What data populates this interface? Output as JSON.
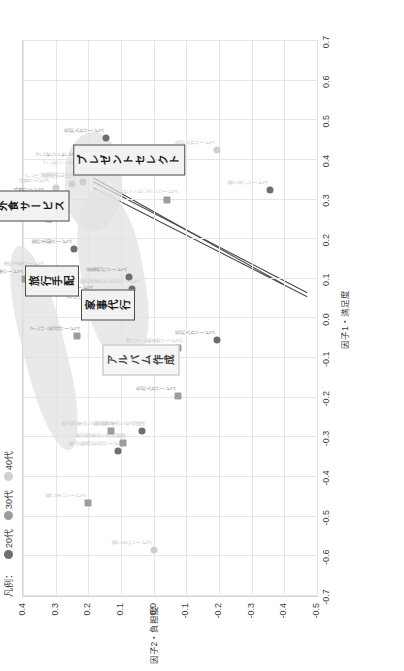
{
  "legend": {
    "label": "凡例：",
    "items": [
      {
        "name": "20代",
        "color": "#6e6e6e"
      },
      {
        "name": "30代",
        "color": "#9d9d9d"
      },
      {
        "name": "40代",
        "color": "#cfcfcf"
      }
    ]
  },
  "chart_data": {
    "type": "scatter",
    "title": "",
    "xlabel": "因子1・満足度",
    "ylabel": "因子2・負担度",
    "xlim": [
      -0.7,
      0.7
    ],
    "ylim": [
      -0.5,
      0.4
    ],
    "xticks": [
      "-0.7",
      "-0.6",
      "-0.5",
      "-0.4",
      "-0.3",
      "-0.2",
      "-0.1",
      "0.0",
      "0.1",
      "0.2",
      "0.3",
      "0.4",
      "0.5",
      "0.6",
      "0.7"
    ],
    "yticks": [
      "0.4",
      "0.3",
      "0.2",
      "0.1",
      "0.0",
      "-0.1",
      "-0.2",
      "-0.3",
      "-0.4",
      "-0.5"
    ],
    "grid": true,
    "legend_position": "top-left",
    "series": [
      {
        "name": "20代",
        "color": "#6e6e6e",
        "marker": "circle",
        "points": [
          {
            "label": "旅行手配サービス",
            "x": 0.175,
            "y": 0.245,
            "tone": "mid"
          },
          {
            "label": "外食サービス",
            "x": 0.305,
            "y": 0.315,
            "tone": "mid"
          },
          {
            "label": "アルバム作成サービス",
            "x": 0.035,
            "y": 0.12,
            "tone": "mid"
          },
          {
            "label": "家事代行サービス",
            "x": 0.105,
            "y": 0.075,
            "tone": "mid"
          },
          {
            "label": "親の将来のための保険",
            "x": -0.285,
            "y": 0.035,
            "tone": "pale"
          },
          {
            "label": "親の結婚記念日サービス",
            "x": -0.335,
            "y": 0.11,
            "tone": "pale"
          },
          {
            "label": "プレゼントセレクトサービス",
            "x": 0.395,
            "y": 0.195,
            "tone": "mid"
          },
          {
            "label": "名刺入れサービス",
            "x": 0.455,
            "y": 0.145,
            "tone": "mid"
          },
          {
            "label": "名刺入れサービス",
            "x": -0.055,
            "y": -0.195,
            "tone": "mid"
          },
          {
            "label": "墓じまいサービス",
            "x": 0.325,
            "y": -0.355,
            "tone": "pale"
          },
          {
            "label": "親の将来のためのサービス",
            "x": 0.075,
            "y": 0.065,
            "tone": "pale"
          }
        ]
      },
      {
        "name": "30代",
        "color": "#9d9d9d",
        "marker": "square",
        "points": [
          {
            "label": "旅行手配サービス",
            "x": 0.1,
            "y": 0.395,
            "tone": "mid"
          },
          {
            "label": "外食サービス",
            "x": 0.25,
            "y": 0.32,
            "tone": "mid"
          },
          {
            "label": "アルバム作成サービス",
            "x": -0.045,
            "y": 0.235,
            "tone": "mid"
          },
          {
            "label": "家事代行サービス",
            "x": 0.06,
            "y": 0.18,
            "tone": "mid"
          },
          {
            "label": "親の将来のための保険",
            "x": -0.315,
            "y": 0.095,
            "tone": "pale"
          },
          {
            "label": "親の将来のための積立て",
            "x": -0.285,
            "y": 0.13,
            "tone": "pale"
          },
          {
            "label": "埋立て（樹木葬サービス）",
            "x": -0.075,
            "y": -0.075,
            "tone": "pale"
          },
          {
            "label": "プレゼントセレクトサービス",
            "x": 0.3,
            "y": -0.04,
            "tone": "pale"
          },
          {
            "label": "名刺入れサービス",
            "x": -0.195,
            "y": -0.075,
            "tone": "mid"
          },
          {
            "label": "墓じまいサービス",
            "x": -0.465,
            "y": 0.2,
            "tone": "pale"
          }
        ]
      },
      {
        "name": "40代",
        "color": "#cfcfcf",
        "marker": "circle",
        "points": [
          {
            "label": "旅行手配サービス",
            "x": 0.12,
            "y": 0.33,
            "tone": "pale"
          },
          {
            "label": "外食サービス",
            "x": 0.33,
            "y": 0.3,
            "tone": "pale"
          },
          {
            "label": "アルバム作成サービス",
            "x": 0.34,
            "y": 0.25,
            "tone": "pale"
          },
          {
            "label": "家事代行サービス",
            "x": 0.345,
            "y": 0.215,
            "tone": "pale"
          },
          {
            "label": "プレゼントセレクトサービス",
            "x": 0.375,
            "y": 0.175,
            "tone": "pale"
          },
          {
            "label": "親の将来のためのサービス",
            "x": -0.115,
            "y": -0.025,
            "tone": "pale"
          },
          {
            "label": "名刺入れサービス",
            "x": 0.425,
            "y": -0.195,
            "tone": "pale"
          },
          {
            "label": "墓じまいサービス",
            "x": -0.585,
            "y": 0.0,
            "tone": "pale"
          }
        ]
      }
    ],
    "callouts": [
      {
        "text": "旅行手配",
        "x": 0.095,
        "y": 0.31,
        "style": "dark"
      },
      {
        "text": "外食サービス",
        "x": 0.285,
        "y": 0.375,
        "style": "dark"
      },
      {
        "text": "家事代行",
        "x": 0.035,
        "y": 0.14,
        "style": "dark"
      },
      {
        "text": "アルバム作成",
        "x": -0.105,
        "y": 0.04,
        "style": "light"
      },
      {
        "text": "プレゼントセレクト",
        "x": 0.4,
        "y": 0.075,
        "style": "dark"
      }
    ]
  }
}
